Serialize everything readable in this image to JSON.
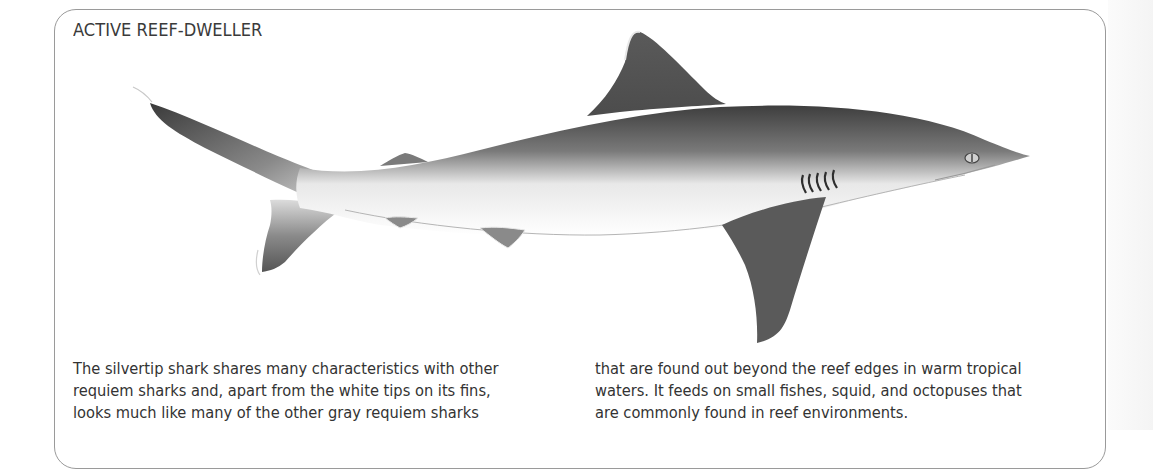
{
  "page": {
    "section_title": "ACTIVE REEF-DWELLER",
    "illustration": {
      "subject": "silvertip shark",
      "description": "Side-view illustration of a silvertip shark facing right, gray body with white underside and white-edged fins"
    },
    "body": {
      "left_column": [
        "The silvertip shark shares many characteristics with other",
        "requiem sharks and, apart from the white tips on its fins,",
        "looks much like many of the other gray requiem sharks"
      ],
      "right_column": [
        "that are found out beyond the reef edges in warm tropical",
        "waters. It feeds on small fishes, squid, and octopuses that",
        "are commonly found in reef environments."
      ]
    },
    "colors": {
      "frame_border": "#9a9a9a",
      "text": "#333333",
      "shark_dark": "#4a4a4a",
      "shark_light": "#f2f2f2"
    }
  }
}
